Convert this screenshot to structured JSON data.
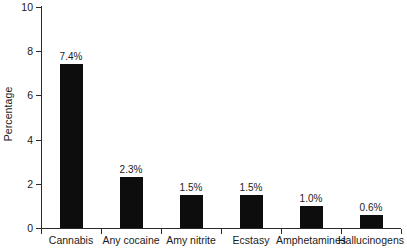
{
  "chart_data": {
    "type": "bar",
    "title": "",
    "xlabel": "",
    "ylabel": "Percentage",
    "categories": [
      "Cannabis",
      "Any cocaine",
      "Amy nitrite",
      "Ecstasy",
      "Amphetamines",
      "Hallucinogens"
    ],
    "values": [
      7.4,
      2.3,
      1.5,
      1.5,
      1.0,
      0.6
    ],
    "data_labels": [
      "7.4%",
      "2.3%",
      "1.5%",
      "1.5%",
      "1.0%",
      "0.6%"
    ],
    "ylim": [
      0,
      10
    ],
    "y_ticks": [
      0,
      2,
      4,
      6,
      8,
      10
    ],
    "y_tick_labels": [
      "0",
      "2",
      "4",
      "6",
      "8",
      "10"
    ],
    "grid": false,
    "legend": false,
    "bar_color": "#0d0d0d",
    "axis_color": "#2b2b2b",
    "background_color": "#ffffff"
  }
}
